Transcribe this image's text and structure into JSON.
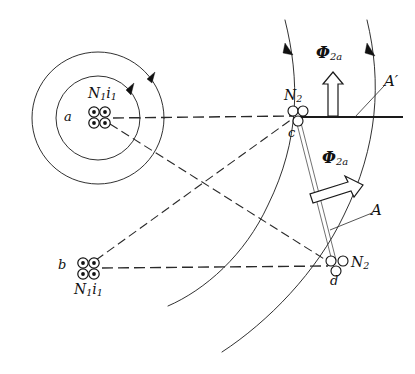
{
  "figure": {
    "background_color": "#ffffff",
    "ink_color": "#111111",
    "width": 415,
    "height": 374
  },
  "labels": {
    "point_a": "a",
    "point_b": "b",
    "point_c": "c",
    "point_d": "d",
    "primary_mmf_top": {
      "symbol": "N",
      "sub1": "1",
      "symbol2": "i",
      "sub2": "1"
    },
    "primary_mmf_bottom": {
      "symbol": "N",
      "sub1": "1",
      "symbol2": "i",
      "sub2": "1"
    },
    "secondary_top": {
      "symbol": "N",
      "sub": "2"
    },
    "secondary_bottom": {
      "symbol": "N",
      "sub": "2"
    },
    "flux_vertical": {
      "symbol": "Φ",
      "sub": "2a"
    },
    "flux_diagonal": {
      "symbol": "Φ",
      "sub": "2a"
    },
    "axis_a_prime": "A′",
    "axis_a": "A"
  },
  "elements": {
    "outer_circle": {
      "name": "outer-field-circle",
      "cx": 98,
      "cy": 118,
      "r": 66
    },
    "inner_circle": {
      "name": "inner-field-circle",
      "cx": 98,
      "cy": 118,
      "r": 42
    },
    "coil_top_left": {
      "name": "primary-coil-a",
      "cx": 100,
      "cy": 117,
      "turns": 4
    },
    "coil_bottom_left": {
      "name": "primary-coil-b",
      "cx": 88,
      "cy": 268,
      "turns": 4
    },
    "coil_top_right": {
      "name": "secondary-coil-c",
      "cx": 297,
      "cy": 113,
      "turns": 3
    },
    "coil_bottom_right": {
      "name": "secondary-coil-d",
      "cx": 335,
      "cy": 265,
      "turns": 3
    }
  },
  "icon_names": {
    "rotation_arrow": "curved-rotation-arrowhead",
    "flux_arrow_up": "hollow-block-arrow-up",
    "flux_arrow_diagonal": "hollow-block-arrow-up-right",
    "field_arrowhead": "field-line-arrowhead"
  }
}
